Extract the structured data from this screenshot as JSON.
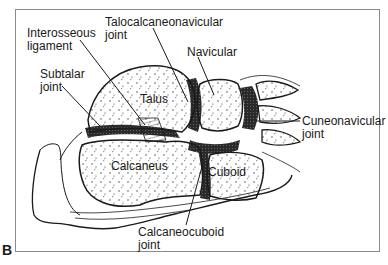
{
  "figure": {
    "panel_letter": "B",
    "labels": {
      "interosseous_ligament": [
        "Interosseous",
        "ligament"
      ],
      "talocalcaneonavicular_joint": [
        "Talocalcaneonavicular",
        "joint"
      ],
      "navicular": "Navicular",
      "subtalar_joint": [
        "Subtalar",
        "joint"
      ],
      "talus": "Talus",
      "cuneonavicular_joint": [
        "Cuneonavicular",
        "joint"
      ],
      "calcaneus": "Calcaneus",
      "cuboid": "Cuboid",
      "calcaneocuboid_joint": [
        "Calcaneocuboid",
        "joint"
      ]
    },
    "colors": {
      "ink": "#1a1a1a",
      "frame": "#8a8a8a",
      "joint_fill": "#2a2a2a",
      "bone_fill": "#ffffff"
    }
  }
}
